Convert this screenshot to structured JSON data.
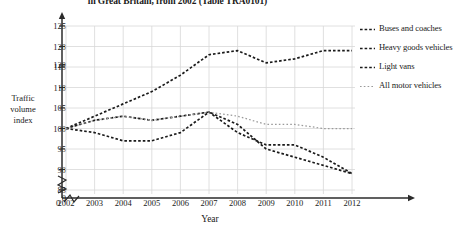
{
  "chart_data": {
    "type": "line",
    "title": "in Great Britain, from 2002 (Table TRA0101)",
    "xlabel": "Year",
    "ylabel": "Traffic volume index",
    "grid": true,
    "legend_position": "right",
    "x": [
      2002,
      2003,
      2004,
      2005,
      2006,
      2007,
      2008,
      2009,
      2010,
      2011,
      2012
    ],
    "xticks": [
      "0",
      "2002",
      "2003",
      "2004",
      "2005",
      "2006",
      "2007",
      "2008",
      "2009",
      "2010",
      "2011",
      "2012"
    ],
    "yticks": [
      "125",
      "120",
      "120",
      "115",
      "110",
      "105",
      "100",
      "95",
      "90",
      "85",
      "0"
    ],
    "ylim": [
      85,
      125
    ],
    "axis_break_x": true,
    "axis_break_y": true,
    "series": [
      {
        "name": "Buses and coaches",
        "style": "dashed-dark",
        "values": [
          100,
          103,
          106,
          109,
          113,
          118,
          119,
          116,
          117,
          119,
          119
        ]
      },
      {
        "name": "Heavy goods vehicles",
        "style": "dashed-dark",
        "values": [
          100,
          102,
          103,
          102,
          103,
          104,
          101,
          95,
          93,
          91,
          89
        ]
      },
      {
        "name": "Light vans",
        "style": "dashed-dark",
        "values": [
          100,
          99,
          97,
          97,
          99,
          104,
          99,
          96,
          96,
          93,
          89
        ]
      },
      {
        "name": "All motor vehicles",
        "style": "dotted-light",
        "values": [
          100,
          102,
          103,
          102,
          103,
          104,
          103,
          101,
          101,
          100,
          100
        ]
      }
    ]
  },
  "legend": {
    "items": [
      {
        "label": "Buses and coaches"
      },
      {
        "label": "Heavy goods vehicles"
      },
      {
        "label": "Light vans"
      },
      {
        "label": "All motor vehicles"
      }
    ]
  },
  "colors": {
    "series_dark": "#1a1a1a",
    "series_light": "#9a9a9a",
    "grid": "#d8d8d8",
    "axis": "#2b2b2b",
    "background": "#ffffff"
  }
}
